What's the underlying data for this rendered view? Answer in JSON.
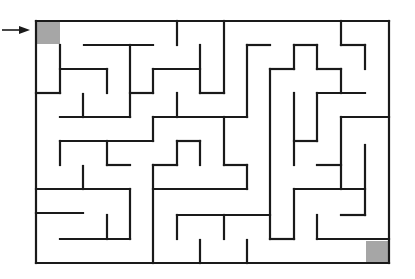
{
  "puzzle": {
    "type": "maze",
    "start_marker_color": "#a6a6a6",
    "end_marker_color": "#a6a6a6",
    "entry_arrow": "arrow-right"
  }
}
